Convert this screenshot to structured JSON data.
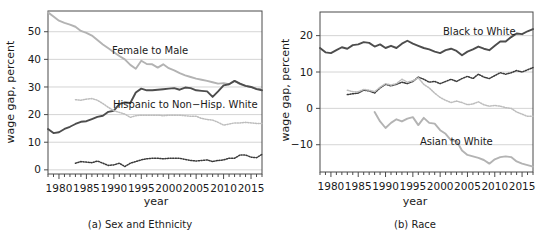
{
  "figure": {
    "panel_count": 2,
    "background": "#ffffff"
  },
  "colors": {
    "dark_series": "#4d4d4d",
    "light_series": "#b3b3b3",
    "dark_dotted": "#3a3a3a",
    "light_dotted": "#bdbdbd",
    "gridline": "#cfcfcf",
    "frame": "#4a4a4a",
    "text": "#1a1a1a"
  },
  "panel_a": {
    "caption": "(a) Sex and Ethnicity",
    "xlabel": "year",
    "ylabel": "wage gap, percent",
    "xticks": [
      "1980",
      "1985",
      "1990",
      "1995",
      "2000",
      "2005",
      "2010",
      "2015"
    ],
    "yticks": [
      "0",
      "10",
      "20",
      "30",
      "40",
      "50"
    ],
    "labels": {
      "female_to_male": "Female to Male",
      "hispanic_to_white": "Hispanic to Non−Hisp. White"
    }
  },
  "panel_b": {
    "caption": "(b) Race",
    "xlabel": "year",
    "ylabel": "wage gap, percent",
    "xticks": [
      "1980",
      "1985",
      "1990",
      "1995",
      "2000",
      "2005",
      "2010",
      "2015"
    ],
    "yticks": [
      "−10",
      "0",
      "10",
      "20"
    ],
    "labels": {
      "black_to_white": "Black to White",
      "asian_to_white": "Asian to White"
    }
  },
  "chart_data": [
    {
      "type": "line",
      "title": "(a) Sex and Ethnicity",
      "xlabel": "year",
      "ylabel": "wage gap, percent",
      "xlim": [
        1978,
        2017
      ],
      "ylim": [
        -1.5,
        57.5
      ],
      "yticks": [
        0,
        10,
        20,
        30,
        40,
        50
      ],
      "xticks": [
        1980,
        1985,
        1990,
        1995,
        2000,
        2005,
        2010,
        2015
      ],
      "grid": true,
      "legend": "inline-annotations",
      "series": [
        {
          "name": "Female to Male",
          "style": "solid",
          "color": "#b3b3b3",
          "annotated": true,
          "x": [
            1978,
            1979,
            1980,
            1981,
            1982,
            1983,
            1984,
            1985,
            1986,
            1987,
            1988,
            1989,
            1990,
            1991,
            1992,
            1993,
            1994,
            1995,
            1996,
            1997,
            1998,
            1999,
            2000,
            2001,
            2002,
            2003,
            2004,
            2005,
            2006,
            2007,
            2008,
            2009,
            2010,
            2011,
            2012,
            2013,
            2014,
            2015,
            2016,
            2017
          ],
          "values": [
            57.0,
            55.5,
            54.0,
            53.2,
            52.6,
            51.8,
            50.3,
            49.6,
            48.6,
            47.0,
            45.4,
            44.0,
            42.6,
            41.2,
            40.0,
            38.0,
            36.6,
            39.5,
            38.3,
            38.2,
            37.0,
            38.2,
            36.8,
            36.0,
            35.0,
            34.2,
            33.6,
            33.0,
            32.6,
            32.2,
            31.7,
            31.2,
            31.4,
            31.0,
            32.2,
            31.0,
            30.4,
            30.0,
            29.4,
            29.2
          ]
        },
        {
          "name": "Hispanic to Non−Hisp. White",
          "style": "solid",
          "color": "#4d4d4d",
          "annotated": true,
          "x": [
            1978,
            1979,
            1980,
            1981,
            1982,
            1983,
            1984,
            1985,
            1986,
            1987,
            1988,
            1989,
            1990,
            1991,
            1992,
            1993,
            1994,
            1995,
            1996,
            1997,
            1998,
            1999,
            2000,
            2001,
            2002,
            2003,
            2004,
            2005,
            2006,
            2007,
            2008,
            2009,
            2010,
            2011,
            2012,
            2013,
            2014,
            2015,
            2016,
            2017
          ],
          "values": [
            14.8,
            13.3,
            13.6,
            14.8,
            15.6,
            16.6,
            17.4,
            17.6,
            18.4,
            19.2,
            19.6,
            21.0,
            21.4,
            23.8,
            24.4,
            24.2,
            28.0,
            29.4,
            28.8,
            28.8,
            29.0,
            29.2,
            29.4,
            29.6,
            29.0,
            29.8,
            29.6,
            28.8,
            28.6,
            28.4,
            26.4,
            28.4,
            30.6,
            31.0,
            32.2,
            31.2,
            30.4,
            30.0,
            29.2,
            28.8
          ]
        },
        {
          "name": "light dotted series",
          "style": "dotted",
          "color": "#bdbdbd",
          "annotated": false,
          "x": [
            1983,
            1984,
            1985,
            1986,
            1987,
            1988,
            1989,
            1990,
            1991,
            1992,
            1993,
            1994,
            1995,
            1996,
            1997,
            1998,
            1999,
            2000,
            2001,
            2002,
            2003,
            2004,
            2005,
            2006,
            2007,
            2008,
            2009,
            2010,
            2011,
            2012,
            2013,
            2014,
            2015,
            2016,
            2017
          ],
          "values": [
            25.4,
            25.2,
            25.6,
            25.8,
            25.2,
            24.0,
            22.6,
            21.4,
            20.8,
            20.2,
            19.0,
            19.6,
            19.8,
            19.8,
            19.8,
            19.8,
            19.6,
            19.8,
            19.8,
            19.8,
            19.6,
            19.4,
            19.4,
            18.6,
            18.2,
            18.0,
            17.2,
            16.2,
            16.6,
            17.0,
            17.0,
            17.2,
            17.0,
            16.8,
            16.8
          ]
        },
        {
          "name": "dark dotted series",
          "style": "dotted",
          "color": "#3a3a3a",
          "annotated": false,
          "x": [
            1983,
            1984,
            1985,
            1986,
            1987,
            1988,
            1989,
            1990,
            1991,
            1992,
            1993,
            1994,
            1995,
            1996,
            1997,
            1998,
            1999,
            2000,
            2001,
            2002,
            2003,
            2004,
            2005,
            2006,
            2007,
            2008,
            2009,
            2010,
            2011,
            2012,
            2013,
            2014,
            2015,
            2016,
            2017
          ],
          "values": [
            2.4,
            3.0,
            2.8,
            2.6,
            3.2,
            2.4,
            1.6,
            1.8,
            2.4,
            1.2,
            2.4,
            3.0,
            3.6,
            4.0,
            4.2,
            4.2,
            4.0,
            4.2,
            4.2,
            4.2,
            3.8,
            3.4,
            3.2,
            3.4,
            3.6,
            3.0,
            3.4,
            3.6,
            4.2,
            4.2,
            5.4,
            5.4,
            4.6,
            4.4,
            5.6
          ]
        }
      ]
    },
    {
      "type": "line",
      "title": "(b) Race",
      "xlabel": "year",
      "ylabel": "wage gap, percent",
      "xlim": [
        1978,
        2017
      ],
      "ylim": [
        -17.5,
        26.5
      ],
      "yticks": [
        -10,
        0,
        10,
        20
      ],
      "xticks": [
        1980,
        1985,
        1990,
        1995,
        2000,
        2005,
        2010,
        2015
      ],
      "grid": true,
      "legend": "inline-annotations",
      "series": [
        {
          "name": "Black to White",
          "style": "solid",
          "color": "#4d4d4d",
          "annotated": true,
          "x": [
            1978,
            1979,
            1980,
            1981,
            1982,
            1983,
            1984,
            1985,
            1986,
            1987,
            1988,
            1989,
            1990,
            1991,
            1992,
            1993,
            1994,
            1995,
            1996,
            1997,
            1998,
            1999,
            2000,
            2001,
            2002,
            2003,
            2004,
            2005,
            2006,
            2007,
            2008,
            2009,
            2010,
            2011,
            2012,
            2013,
            2014,
            2015,
            2016,
            2017
          ],
          "values": [
            16.6,
            15.4,
            15.2,
            16.0,
            16.8,
            16.4,
            17.4,
            17.6,
            18.2,
            18.0,
            17.0,
            17.6,
            16.6,
            17.2,
            16.6,
            17.8,
            18.6,
            17.8,
            17.2,
            16.6,
            16.2,
            15.6,
            15.2,
            16.0,
            16.4,
            15.8,
            14.6,
            15.6,
            16.2,
            17.0,
            16.4,
            16.0,
            17.2,
            18.4,
            18.4,
            19.6,
            20.6,
            20.4,
            21.2,
            21.8
          ]
        },
        {
          "name": "dark dotted series",
          "style": "dotted",
          "color": "#3a3a3a",
          "annotated": false,
          "x": [
            1983,
            1984,
            1985,
            1986,
            1987,
            1988,
            1989,
            1990,
            1991,
            1992,
            1993,
            1994,
            1995,
            1996,
            1997,
            1998,
            1999,
            2000,
            2001,
            2002,
            2003,
            2004,
            2005,
            2006,
            2007,
            2008,
            2009,
            2010,
            2011,
            2012,
            2013,
            2014,
            2015,
            2016,
            2017
          ],
          "values": [
            3.8,
            4.0,
            4.2,
            5.0,
            4.8,
            4.2,
            5.6,
            6.6,
            6.2,
            6.6,
            7.2,
            6.8,
            7.4,
            8.6,
            8.0,
            7.2,
            7.4,
            6.8,
            7.4,
            8.0,
            7.4,
            8.2,
            8.8,
            8.2,
            9.4,
            8.6,
            8.2,
            9.0,
            9.8,
            9.4,
            9.8,
            10.4,
            10.0,
            10.6,
            11.2
          ]
        },
        {
          "name": "light dotted series",
          "style": "dotted",
          "color": "#bdbdbd",
          "annotated": false,
          "x": [
            1983,
            1984,
            1985,
            1986,
            1987,
            1988,
            1989,
            1990,
            1991,
            1992,
            1993,
            1994,
            1995,
            1996,
            1997,
            1998,
            1999,
            2000,
            2001,
            2002,
            2003,
            2004,
            2005,
            2006,
            2007,
            2008,
            2009,
            2010,
            2011,
            2012,
            2013,
            2014,
            2015,
            2016,
            2017
          ],
          "values": [
            5.0,
            4.6,
            4.6,
            5.2,
            5.0,
            4.6,
            5.8,
            6.8,
            6.4,
            6.8,
            8.0,
            7.2,
            7.6,
            8.4,
            6.6,
            5.6,
            4.2,
            3.0,
            2.2,
            1.6,
            2.0,
            1.6,
            1.0,
            1.2,
            1.8,
            1.0,
            0.6,
            0.8,
            0.6,
            0.2,
            0.0,
            -1.0,
            -1.6,
            -2.2,
            -2.2
          ]
        },
        {
          "name": "Asian to White",
          "style": "solid",
          "color": "#b3b3b3",
          "annotated": true,
          "x": [
            1988,
            1989,
            1990,
            1991,
            1992,
            1993,
            1994,
            1995,
            1996,
            1997,
            1998,
            1999,
            2000,
            2001,
            2002,
            2003,
            2004,
            2005,
            2006,
            2007,
            2008,
            2009,
            2010,
            2011,
            2012,
            2013,
            2014,
            2015,
            2016,
            2017
          ],
          "values": [
            -1.0,
            -3.6,
            -5.4,
            -4.0,
            -3.0,
            -3.6,
            -2.8,
            -2.4,
            -4.6,
            -2.6,
            -4.0,
            -4.2,
            -6.0,
            -7.0,
            -8.8,
            -9.0,
            -11.6,
            -12.8,
            -13.2,
            -13.6,
            -14.2,
            -15.2,
            -14.0,
            -13.4,
            -13.2,
            -13.4,
            -14.6,
            -15.2,
            -15.6,
            -16.0
          ]
        }
      ]
    }
  ]
}
